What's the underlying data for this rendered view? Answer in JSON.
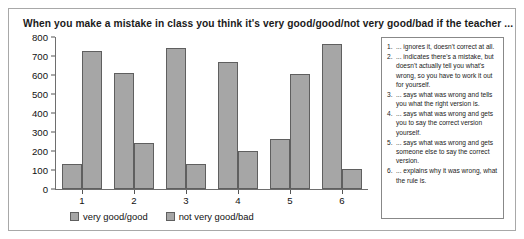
{
  "chart_data": {
    "type": "bar",
    "title": "When you make a mistake in class you think it's very good/good/not very good/bad if the teacher ...",
    "xlabel": "",
    "ylabel": "",
    "categories": [
      "1",
      "2",
      "3",
      "4",
      "5",
      "6"
    ],
    "series": [
      {
        "name": "very good/good",
        "values": [
          130,
          610,
          740,
          670,
          265,
          765
        ]
      },
      {
        "name": "not very good/bad",
        "values": [
          725,
          240,
          130,
          200,
          605,
          105
        ]
      }
    ],
    "ylim": [
      0,
      800
    ],
    "yticks": [
      0,
      100,
      200,
      300,
      400,
      500,
      600,
      700,
      800
    ],
    "ytick_labels": [
      "0",
      "100",
      "200",
      "300",
      "400",
      "500",
      "600",
      "700",
      "800"
    ],
    "grid": false,
    "legend_position": "bottom-left",
    "bar_color": "#a6a6a6",
    "bar_edge_color": "#5f5f5f"
  },
  "legend": {
    "entries": [
      {
        "label": "very good/good"
      },
      {
        "label": "not very good/bad"
      }
    ]
  },
  "key_box": {
    "items": [
      {
        "num": "1.",
        "text": "... ignores it, doesn't correct at all."
      },
      {
        "num": "2.",
        "text": "... indicates there's a mistake, but doesn't actually tell you what's wrong, so you have to work it out for yourself."
      },
      {
        "num": "3.",
        "text": "... says what was wrong and tells you what the right version is."
      },
      {
        "num": "4.",
        "text": "... says what was wrong and gets you to say the correct version yourself."
      },
      {
        "num": "5.",
        "text": "... says what was wrong and gets someone else to say the correct version."
      },
      {
        "num": "6.",
        "text": "... explains why it was wrong, what the rule is."
      }
    ]
  }
}
